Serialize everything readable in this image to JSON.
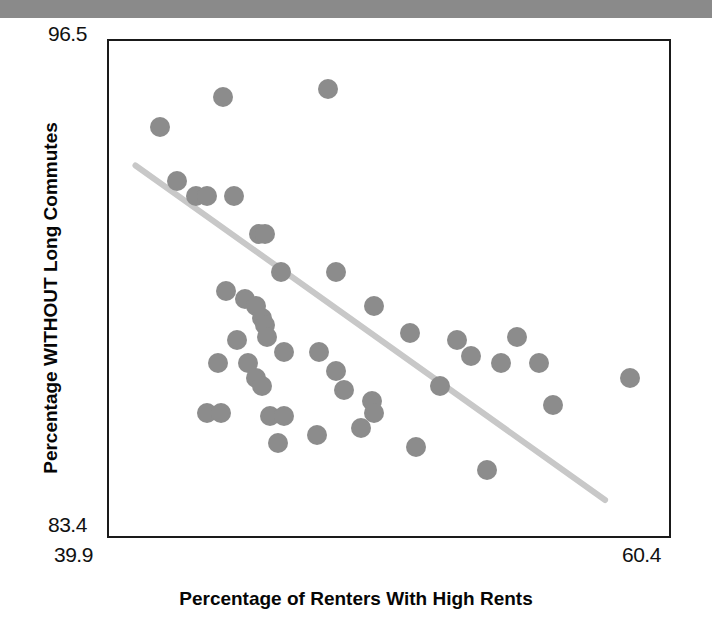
{
  "figure": {
    "header_bar_color": "#8a8a8a",
    "point_color": "#8c8c8c",
    "trend_line_color": "#c8c8c8",
    "frame_color": "#1a1a1a"
  },
  "chart_data": {
    "type": "scatter",
    "title": "",
    "subtitle": "",
    "xlabel": "Percentage of Renters With High Rents",
    "ylabel": "Percentage WITHOUT Long Commutes",
    "xlim": [
      39.9,
      60.4
    ],
    "ylim": [
      83.4,
      96.5
    ],
    "xticks": [
      39.9,
      60.4
    ],
    "xticklabels": [
      "39.9",
      "60.4"
    ],
    "yticks": [
      83.4,
      96.5
    ],
    "yticklabels": [
      "83.4",
      "96.5"
    ],
    "grid": false,
    "legend": null,
    "annotations": [],
    "trendline": {
      "type": "linear-fit",
      "x": [
        40.9,
        58.0
      ],
      "y": [
        93.2,
        84.4
      ],
      "color": "#c8c8c8",
      "width": 6
    },
    "series": [
      {
        "name": "Counties",
        "marker": "circle",
        "color": "#8c8c8c",
        "points": [
          [
            41.8,
            94.2
          ],
          [
            44.1,
            95.0
          ],
          [
            47.9,
            95.2
          ],
          [
            42.4,
            92.8
          ],
          [
            43.1,
            92.4
          ],
          [
            43.5,
            92.4
          ],
          [
            44.5,
            92.4
          ],
          [
            45.4,
            91.4
          ],
          [
            45.6,
            91.4
          ],
          [
            46.2,
            90.4
          ],
          [
            48.2,
            90.4
          ],
          [
            44.2,
            89.9
          ],
          [
            44.9,
            89.7
          ],
          [
            45.3,
            89.5
          ],
          [
            45.5,
            89.2
          ],
          [
            45.6,
            89.0
          ],
          [
            45.7,
            88.7
          ],
          [
            49.6,
            89.5
          ],
          [
            44.6,
            88.6
          ],
          [
            50.9,
            88.8
          ],
          [
            46.3,
            88.3
          ],
          [
            47.6,
            88.3
          ],
          [
            43.9,
            88.0
          ],
          [
            45.0,
            88.0
          ],
          [
            45.3,
            87.6
          ],
          [
            45.5,
            87.4
          ],
          [
            48.2,
            87.8
          ],
          [
            52.6,
            88.6
          ],
          [
            53.1,
            88.2
          ],
          [
            54.8,
            88.7
          ],
          [
            54.2,
            88.0
          ],
          [
            55.6,
            88.0
          ],
          [
            48.5,
            87.3
          ],
          [
            52.0,
            87.4
          ],
          [
            43.5,
            86.7
          ],
          [
            44.0,
            86.7
          ],
          [
            45.8,
            86.6
          ],
          [
            46.3,
            86.6
          ],
          [
            49.5,
            87.0
          ],
          [
            49.6,
            86.7
          ],
          [
            46.1,
            85.9
          ],
          [
            47.5,
            86.1
          ],
          [
            49.1,
            86.3
          ],
          [
            51.1,
            85.8
          ],
          [
            53.7,
            85.2
          ],
          [
            58.9,
            87.6
          ],
          [
            56.1,
            86.9
          ]
        ]
      }
    ]
  }
}
